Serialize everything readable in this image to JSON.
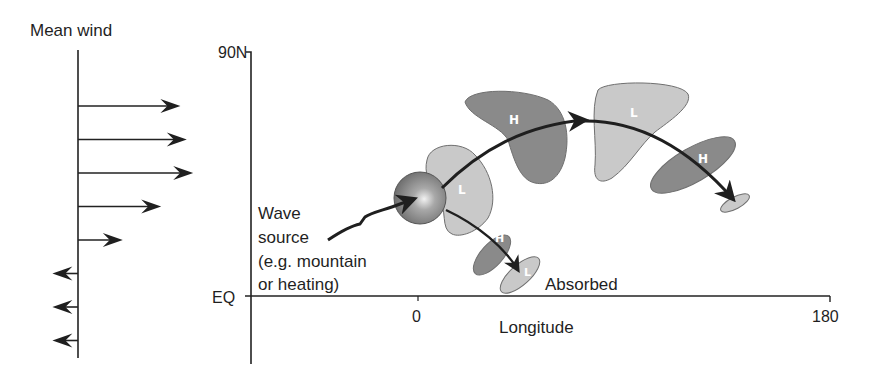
{
  "mean_wind": {
    "title": "Mean wind",
    "profile": [
      {
        "direction": "eastward",
        "relative_speed": 0.8
      },
      {
        "direction": "eastward",
        "relative_speed": 0.85
      },
      {
        "direction": "eastward",
        "relative_speed": 0.9
      },
      {
        "direction": "eastward",
        "relative_speed": 0.65
      },
      {
        "direction": "eastward",
        "relative_speed": 0.35
      },
      {
        "direction": "westward",
        "relative_speed": 0.2
      },
      {
        "direction": "westward",
        "relative_speed": 0.2
      },
      {
        "direction": "westward",
        "relative_speed": 0.2
      }
    ]
  },
  "axes": {
    "y_top": "90N",
    "y_bottom": "EQ",
    "x_tick_0": "0",
    "x_tick_180": "180",
    "x_label": "Longitude"
  },
  "source": {
    "line1": "Wave",
    "line2": "source",
    "line3": "(e.g. mountain",
    "line4": "or heating)"
  },
  "absorbed_label": "Absorbed",
  "anomalies": [
    {
      "id": "L1",
      "label": "L",
      "type": "low"
    },
    {
      "id": "H1",
      "label": "H",
      "type": "high"
    },
    {
      "id": "L2",
      "label": "L",
      "type": "low"
    },
    {
      "id": "H2",
      "label": "H",
      "type": "high"
    },
    {
      "id": "L3",
      "label": "",
      "type": "low"
    },
    {
      "id": "H3",
      "label": "H",
      "type": "high"
    },
    {
      "id": "L4",
      "label": "L",
      "type": "low"
    }
  ],
  "colors": {
    "high": "#8a8a8a",
    "low": "#c9c9c9",
    "outline": "#6f6f6f",
    "ink": "#1f1f1f"
  }
}
